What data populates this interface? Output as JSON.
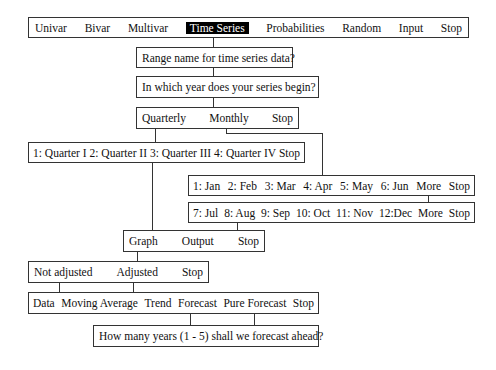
{
  "main_menu": {
    "items": [
      "Univar",
      "Bivar",
      "Multivar",
      "Time Series",
      "Probabilities",
      "Random",
      "Input",
      "Stop"
    ],
    "selected": "Time Series"
  },
  "prompts": {
    "range_name": "Range name for time series data?",
    "start_year": "In which year does your series begin?",
    "forecast_years": "How many years (1 - 5) shall we forecast ahead?"
  },
  "frequency_menu": {
    "items": [
      "Quarterly",
      "Monthly",
      "Stop"
    ]
  },
  "quarter_menu": {
    "items": [
      "1: Quarter I",
      "2: Quarter II",
      "3: Quarter III",
      "4: Quarter IV",
      "Stop"
    ]
  },
  "month_menu_1": {
    "items": [
      "1: Jan",
      "2: Feb",
      "3: Mar",
      "4: Apr",
      "5: May",
      "6: Jun",
      "More",
      "Stop"
    ]
  },
  "month_menu_2": {
    "items": [
      "7: Jul",
      "8: Aug",
      "9: Sep",
      "10: Oct",
      "11: Nov",
      "12:Dec",
      "More",
      "Stop"
    ]
  },
  "output_menu": {
    "items": [
      "Graph",
      "Output",
      "Stop"
    ]
  },
  "adjust_menu": {
    "items": [
      "Not adjusted",
      "Adjusted",
      "Stop"
    ]
  },
  "series_menu": {
    "items": [
      "Data",
      "Moving Average",
      "Trend",
      "Forecast",
      "Pure Forecast",
      "Stop"
    ]
  },
  "colors": {
    "line": "#333333",
    "selected_bg": "#000000",
    "selected_fg": "#ffffff"
  }
}
